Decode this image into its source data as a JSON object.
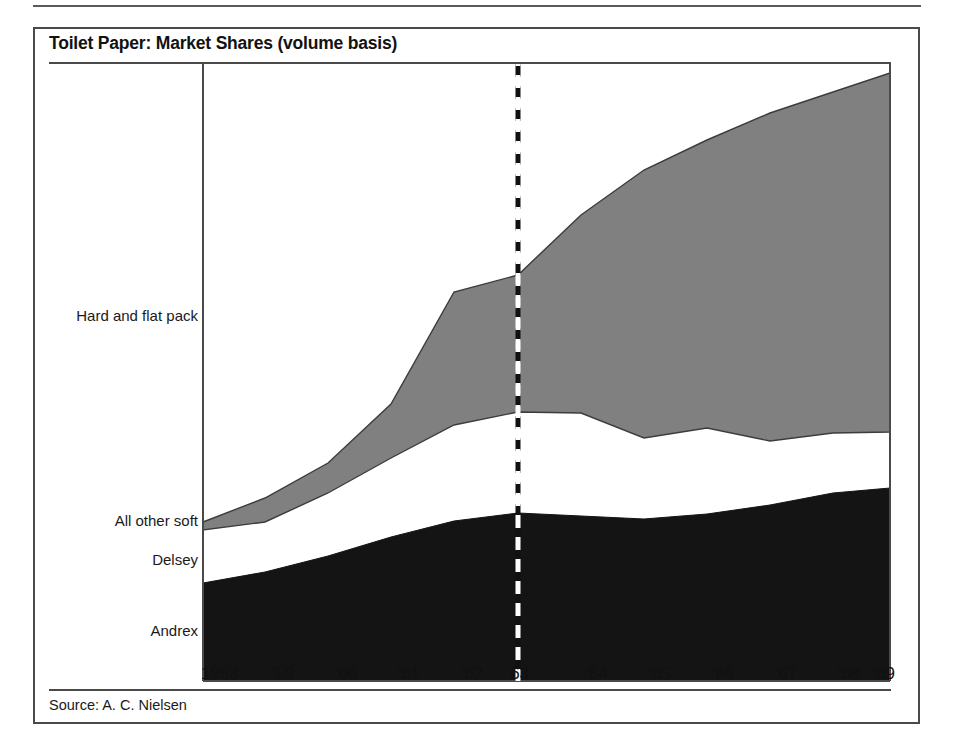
{
  "figure": {
    "title": "Toilet Paper: Market Shares (volume basis)",
    "source": "Source: A. C. Nielsen"
  },
  "colors": {
    "grey_band": "#808080",
    "black_band": "#141414",
    "white_band": "#ffffff",
    "axis_line": "#4a4a4a",
    "frame": "#4a4a4a",
    "text": "#1a1a1a",
    "dashed_marker": "#111111"
  },
  "series_labels": [
    {
      "name": "hard-and-flat-pack",
      "label": "Hard and flat pack",
      "top": 307
    },
    {
      "name": "all-other-soft",
      "label": "All other soft",
      "top": 512
    },
    {
      "name": "delsey",
      "label": "Delsey",
      "top": 551
    },
    {
      "name": "andrex",
      "label": "Andrex",
      "top": 622
    }
  ],
  "x_axis": {
    "ticks": [
      "1958",
      "'59",
      "'60",
      "'61",
      "'62",
      "'63",
      "'64",
      "'65",
      "'66",
      "'67",
      "'68",
      "'69"
    ],
    "tick_x": [
      220,
      283,
      346,
      409,
      472,
      518,
      597,
      660,
      723,
      786,
      849,
      884
    ],
    "label_y": 664
  },
  "marker_line": {
    "label": "'63",
    "x": 518,
    "y_top": 64,
    "y_bottom": 681,
    "style": "dashed"
  },
  "chart_data": {
    "type": "area",
    "title": "Toilet Paper: Market Shares (volume basis)",
    "subtitle": "",
    "xlabel": "",
    "ylabel": "",
    "stacked": true,
    "grid": false,
    "legend": "inline-left-labels",
    "note": "Stacked 100% area chart of UK toilet paper market share by volume. Bands bottom-to-top: Andrex (black), Delsey (black, merged with Andrex visually), All other soft (white), Hard and flat pack (grey). Vertical dashed line marks 1963.",
    "x": [
      "1958",
      "1959",
      "1960",
      "1961",
      "1962",
      "1963",
      "1964",
      "1965",
      "1966",
      "1967",
      "1968",
      "1969"
    ],
    "ylim": [
      0,
      100
    ],
    "series": [
      {
        "name": "Andrex and Delsey",
        "color": "#141414",
        "values": [
          15.8,
          18.0,
          20.6,
          23.9,
          25.9,
          27.8,
          27.6,
          27.0,
          27.6,
          29.4,
          31.4,
          32.2
        ]
      },
      {
        "name": "All other soft",
        "color": "#ffffff",
        "values": [
          68.4,
          63.0,
          56.8,
          48.9,
          38.9,
          31.8,
          27.3,
          25.5,
          23.8,
          21.8,
          20.0,
          19.4
        ]
      },
      {
        "name": "Hard and flat pack",
        "color": "#808080",
        "values": [
          15.8,
          19.0,
          22.6,
          27.2,
          35.2,
          40.4,
          45.1,
          47.5,
          48.6,
          48.8,
          48.6,
          48.4
        ]
      }
    ],
    "boundaries_pixel": {
      "note": "Pixel y-coordinates of band boundaries at each year x position, for faithful redraw.",
      "plot_left": 203,
      "plot_right": 890,
      "plot_top": 64,
      "plot_bottom": 681,
      "x_positions": [
        203,
        265,
        328,
        391,
        454,
        518,
        581,
        644,
        707,
        770,
        833,
        890
      ],
      "grey_top": [
        522,
        498,
        463,
        404,
        292,
        275,
        215,
        170,
        140,
        113,
        92,
        73
      ],
      "grey_bottom": [
        530,
        522,
        493,
        458,
        425,
        412,
        413,
        438,
        428,
        441,
        433,
        432
      ],
      "black_top": [
        583,
        572,
        556,
        537,
        521,
        513,
        516,
        519,
        514,
        505,
        493,
        488
      ]
    }
  }
}
